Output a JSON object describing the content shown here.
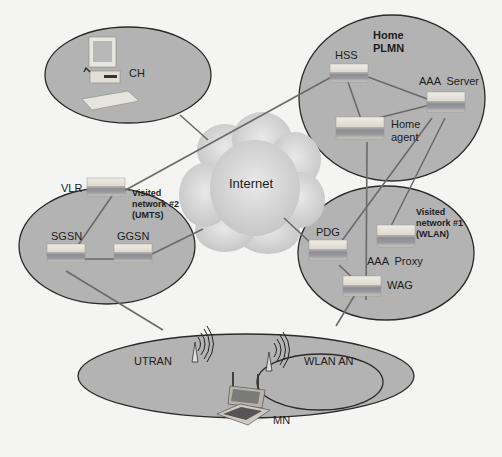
{
  "diagram": {
    "type": "network-architecture",
    "colors": {
      "background": "#f4f4f2",
      "network_fill": "#b3b3b3",
      "network_stroke": "#2a2a2a",
      "link": "#6a6a6a",
      "cloud": "#d4d4d4",
      "device_top": "#e6e2da",
      "device_band": "#8e8e94"
    },
    "internet": {
      "label": "Internet"
    },
    "networks": {
      "ch": {
        "label": "CH"
      },
      "home_plmn": {
        "label": "Home PLMN",
        "line1": "Home",
        "line2": "PLMN"
      },
      "visited2": {
        "line1": "Visited",
        "line2": "network #2",
        "line3": "(UMTS)"
      },
      "visited1": {
        "line1": "Visited",
        "line2": "network #1",
        "line3": "(WLAN)"
      },
      "access": {
        "utran": "UTRAN",
        "wlan_an": "WLAN AN"
      }
    },
    "nodes": {
      "hss": "HSS",
      "aaa_server": "AAA  Server",
      "home_agent_1": "Home",
      "home_agent_2": "agent",
      "vlr": "VLR",
      "sgsn": "SGSN",
      "ggsn": "GGSN",
      "pdg": "PDG",
      "aaa_proxy": "AAA  Proxy",
      "wag": "WAG",
      "mn": "MN"
    },
    "links": [
      [
        "CH",
        "Internet"
      ],
      [
        "VLR",
        "HSS"
      ],
      [
        "HSS",
        "AAA Server"
      ],
      [
        "HSS",
        "Home agent"
      ],
      [
        "Home agent",
        "AAA Server"
      ],
      [
        "Home agent",
        "WAG"
      ],
      [
        "AAA Server",
        "PDG"
      ],
      [
        "AAA Server",
        "AAA Proxy"
      ],
      [
        "VLR",
        "SGSN"
      ],
      [
        "SGSN",
        "GGSN"
      ],
      [
        "GGSN",
        "Internet"
      ],
      [
        "SGSN",
        "UTRAN"
      ],
      [
        "Internet",
        "PDG"
      ],
      [
        "PDG",
        "WAG"
      ],
      [
        "WAG",
        "WLAN AN"
      ]
    ]
  }
}
